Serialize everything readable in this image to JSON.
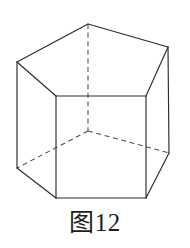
{
  "figure": {
    "caption": "图12",
    "shape_name": "pentagonal-prism",
    "line_color": "#2b2b32",
    "hidden_line_color": "#4a4a52",
    "fill_color": "#ffffff",
    "background_color": "#ffffff",
    "geometry": {
      "top_face": {
        "visible": true,
        "points": "88,24 168,47 146,96 56,96 17,62"
      },
      "front_left_face": {
        "visible": true,
        "points": "17,62 56,96 56,198 17,168"
      },
      "front_face": {
        "visible": true,
        "points": "56,96 146,96 146,198 56,198"
      },
      "front_right_face": {
        "visible": true,
        "points": "146,96 168,47 169,153 146,198"
      },
      "solid_edges": [
        "88,24 168,47",
        "88,24 17,62",
        "17,62 56,96",
        "56,96 146,96",
        "146,96 168,47",
        "17,62 17,168",
        "56,96 56,198",
        "146,96 146,198",
        "168,47 169,153",
        "17,168 56,198",
        "56,198 146,198",
        "146,198 169,153"
      ],
      "hidden_edges": [
        "88,24 88,131",
        "88,131 17,168",
        "88,131 169,153"
      ],
      "vertices": {
        "top_apex": [
          88,
          24
        ],
        "top_right": [
          168,
          47
        ],
        "top_left": [
          17,
          62
        ],
        "top_front_right": [
          146,
          96
        ],
        "top_front_left": [
          56,
          96
        ],
        "bottom_apex_hidden": [
          88,
          131
        ],
        "bottom_right": [
          169,
          153
        ],
        "bottom_left": [
          17,
          168
        ],
        "bottom_front_right": [
          146,
          198
        ],
        "bottom_front_left": [
          56,
          198
        ]
      }
    }
  }
}
